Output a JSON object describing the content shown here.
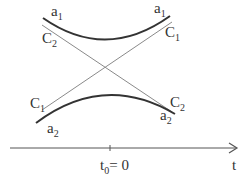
{
  "diagram": {
    "labels": {
      "a1_left": "a",
      "a1_left_sub": "1",
      "a1_right": "a",
      "a1_right_sub": "1",
      "c2_left": "C",
      "c2_left_sub": "2",
      "c1_right": "C",
      "c1_right_sub": "1",
      "c1_left": "C",
      "c1_left_sub": "1",
      "a2_left": "a",
      "a2_left_sub": "2",
      "c2_right": "C",
      "c2_right_sub": "2",
      "a2_right": "a",
      "a2_right_sub": "2"
    },
    "axis": {
      "t0_label": "t",
      "t0_sub": "0",
      "t0_value": "= 0",
      "axis_label": "t"
    },
    "colors": {
      "curve": "#333333",
      "line": "#888888",
      "text": "#333333"
    }
  }
}
